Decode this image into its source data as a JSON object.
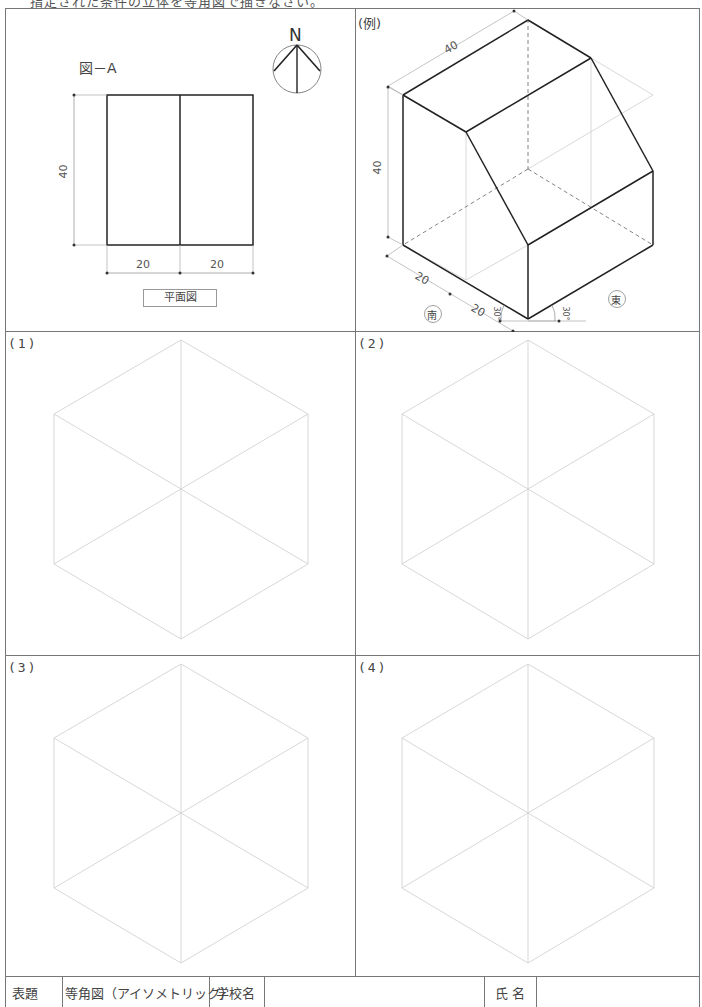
{
  "header": {
    "instruction_partial": "指定された条件の立体を等角図で描きなさい。"
  },
  "panel_a": {
    "figure_label": "図－A",
    "north_label": "N",
    "dim_height": "40",
    "dim_left": "20",
    "dim_right": "20",
    "caption": "平面図"
  },
  "panel_example": {
    "label": "(例)",
    "dim_top": "40",
    "dim_height": "40",
    "dim_south_1": "20",
    "dim_south_2": "20",
    "angle_left": "30°",
    "angle_right": "30°",
    "south_label": "南",
    "east_label": "東"
  },
  "exercise_panels": [
    {
      "label": "(1)"
    },
    {
      "label": "(2)"
    },
    {
      "label": "(3)"
    },
    {
      "label": "(4)"
    }
  ],
  "title_block": {
    "title_heading": "表題",
    "title_value": "等角図（アイソメトリック）",
    "school_heading": "学校名",
    "school_value": "",
    "name_heading": "氏 名",
    "name_value": ""
  },
  "colors": {
    "frame": "#777777",
    "guide_lines": "#cfcfcf",
    "solid_edges": "#222222",
    "dim_lines": "#999999"
  }
}
